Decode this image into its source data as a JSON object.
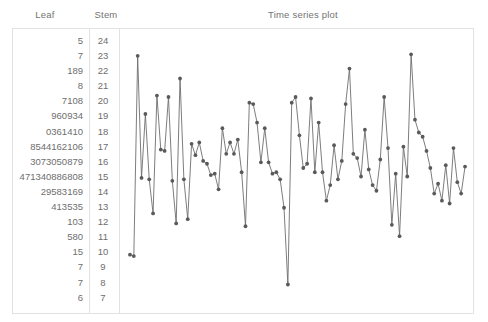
{
  "headers": {
    "leaf": "Leaf",
    "stem": "Stem",
    "title": "Time series plot"
  },
  "stem_and_leaf": {
    "rows": [
      {
        "leaf": "5",
        "stem": "24"
      },
      {
        "leaf": "7",
        "stem": "23"
      },
      {
        "leaf": "189",
        "stem": "22"
      },
      {
        "leaf": "8",
        "stem": "21"
      },
      {
        "leaf": "7108",
        "stem": "20"
      },
      {
        "leaf": "960934",
        "stem": "19"
      },
      {
        "leaf": "0361410",
        "stem": "18"
      },
      {
        "leaf": "8544162106",
        "stem": "17"
      },
      {
        "leaf": "3073050879",
        "stem": "16"
      },
      {
        "leaf": "471340886808",
        "stem": "15"
      },
      {
        "leaf": "29583169",
        "stem": "14"
      },
      {
        "leaf": "413535",
        "stem": "13"
      },
      {
        "leaf": "103",
        "stem": "12"
      },
      {
        "leaf": "580",
        "stem": "11"
      },
      {
        "leaf": "15",
        "stem": "10"
      },
      {
        "leaf": "7",
        "stem": "9"
      },
      {
        "leaf": "7",
        "stem": "8"
      },
      {
        "leaf": "6",
        "stem": "7"
      }
    ]
  },
  "chart_data": {
    "type": "line",
    "title": "Time series plot",
    "xlabel": "",
    "ylabel": "",
    "grid": false,
    "legend": "none",
    "marker": "filled-circle",
    "line_color": "#6e6e6e",
    "marker_color": "#5a5a5a",
    "xlim": [
      1,
      88
    ],
    "ylim": [
      70,
      246
    ],
    "x": [
      1,
      2,
      3,
      4,
      5,
      6,
      7,
      8,
      9,
      10,
      11,
      12,
      13,
      14,
      15,
      16,
      17,
      18,
      19,
      20,
      21,
      22,
      23,
      24,
      25,
      26,
      27,
      28,
      29,
      30,
      31,
      32,
      33,
      34,
      35,
      36,
      37,
      38,
      39,
      40,
      41,
      42,
      43,
      44,
      45,
      46,
      47,
      48,
      49,
      50,
      51,
      52,
      53,
      54,
      55,
      56,
      57,
      58,
      59,
      60,
      61,
      62,
      63,
      64,
      65,
      66,
      67,
      68,
      69,
      70,
      71,
      72,
      73,
      74,
      75,
      76,
      77,
      78,
      79,
      80,
      81,
      82,
      83,
      84,
      85,
      86,
      87,
      88
    ],
    "values": [
      97,
      96,
      237,
      151,
      196,
      150,
      126,
      209,
      171,
      170,
      208,
      149,
      119,
      221,
      150,
      122,
      175,
      167,
      176,
      163,
      161,
      153,
      154,
      143,
      186,
      168,
      176,
      168,
      178,
      155,
      117,
      204,
      203,
      190,
      162,
      186,
      162,
      154,
      155,
      150,
      130,
      76,
      204,
      208,
      181,
      158,
      161,
      207,
      155,
      190,
      155,
      135,
      146,
      174,
      150,
      163,
      203,
      228,
      168,
      165,
      152,
      185,
      157,
      146,
      142,
      164,
      208,
      172,
      118,
      154,
      110,
      173,
      152,
      238,
      192,
      183,
      180,
      170,
      158,
      140,
      147,
      135,
      160,
      133,
      172,
      148,
      140,
      159
    ]
  }
}
